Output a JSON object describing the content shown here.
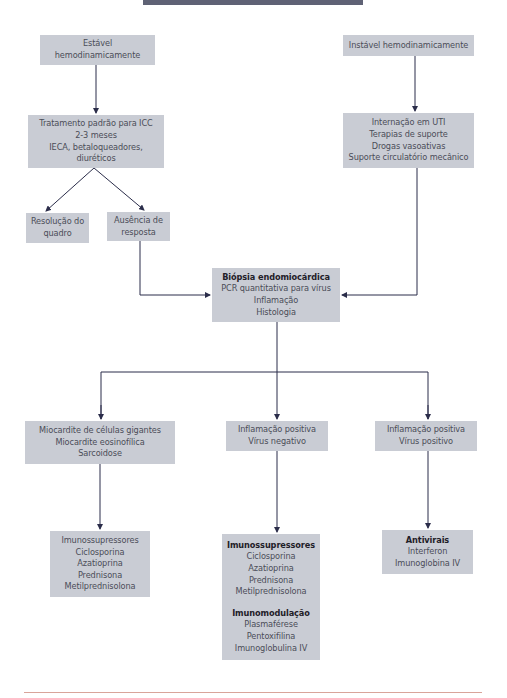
{
  "header_bar": {
    "color": "#5f6275"
  },
  "colors": {
    "box_fill": "#c9ccd4",
    "text": "#4b4d58",
    "arrow": "#2b2d4a",
    "footer_rule": "#d9a49a"
  },
  "nodes": {
    "stable": {
      "lines": [
        "Estável",
        "hemodinamicamente"
      ]
    },
    "unstable": {
      "lines": [
        "Instável hemodinamicamente"
      ]
    },
    "standard_treatment": {
      "lines": [
        "Tratamento padrão para ICC",
        "2-3 meses",
        "IECA, betaloqueadores,",
        "diuréticos"
      ]
    },
    "icu": {
      "lines": [
        "Internação em UTI",
        "Terapias de suporte",
        "Drogas vasoativas",
        "Suporte circulatório mecânico"
      ]
    },
    "resolution": {
      "lines": [
        "Resolução do",
        "quadro"
      ]
    },
    "no_response": {
      "lines": [
        "Ausência de",
        "resposta"
      ]
    },
    "biopsy": {
      "title": "Biópsia endomiocárdica",
      "lines": [
        "PCR quantitativa para vírus",
        "Inflamação",
        "Histologia"
      ]
    },
    "giant_cell": {
      "lines": [
        "Miocardite de células gigantes",
        "Miocardite eosinofílica",
        "Sarcoidose"
      ]
    },
    "virus_negative": {
      "lines": [
        "Inflamação positiva",
        "Vírus negativo"
      ]
    },
    "virus_positive": {
      "lines": [
        "Inflamação positiva",
        "Vírus positivo"
      ]
    },
    "immunosuppressors_left": {
      "lines": [
        "Imunossupressores",
        "Ciclosporina",
        "Azatioprina",
        "Prednisona",
        "Metilprednisolona"
      ]
    },
    "immuno_middle": {
      "title1": "Imunossupressores",
      "lines1": [
        "Ciclosporina",
        "Azatioprina",
        "Prednisona",
        "Metilprednisolona"
      ],
      "title2": "Imunomodulação",
      "lines2": [
        "Plasmaférese",
        "Pentoxifilina",
        "Imunoglobulina IV"
      ]
    },
    "antivirals": {
      "title": "Antivirais",
      "lines": [
        "Interferon",
        "Imunoglobina IV"
      ]
    }
  }
}
